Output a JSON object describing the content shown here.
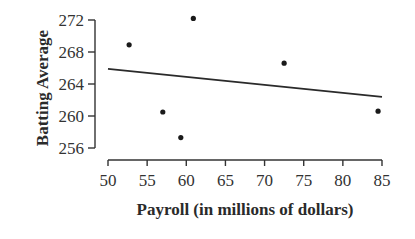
{
  "chart_data": {
    "type": "scatter",
    "title": "",
    "xlabel": "Payroll (in millions of dollars)",
    "ylabel": "Batting Average",
    "xlim": [
      50,
      85
    ],
    "ylim": [
      256,
      272
    ],
    "xticks": [
      50,
      55,
      60,
      65,
      70,
      75,
      80,
      85
    ],
    "yticks": [
      256,
      260,
      264,
      268,
      272
    ],
    "grid": false,
    "legend": null,
    "points": [
      {
        "x": 52.7,
        "y": 268.9
      },
      {
        "x": 60.9,
        "y": 272.2
      },
      {
        "x": 57.0,
        "y": 260.5
      },
      {
        "x": 59.3,
        "y": 257.3
      },
      {
        "x": 72.5,
        "y": 266.6
      },
      {
        "x": 84.5,
        "y": 260.6
      }
    ],
    "trend_line": {
      "x1": 50,
      "y1": 265.9,
      "x2": 85,
      "y2": 262.4
    },
    "colors": {
      "points": "#1a1a1a",
      "line": "#2a2a2a",
      "axes": "#333333"
    }
  }
}
